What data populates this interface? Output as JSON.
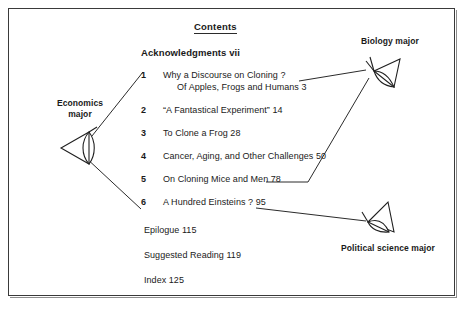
{
  "page": {
    "heading": "Contents",
    "acknowledgments": "Acknowledgments  vii"
  },
  "contents": {
    "chapters": [
      {
        "number": "1",
        "title": "Why a Discourse on Cloning ?",
        "subtitle": "Of Apples, Frogs and Humans  3"
      },
      {
        "number": "2",
        "title": "“A Fantastical Experiment”  14",
        "subtitle": ""
      },
      {
        "number": "3",
        "title": "To Clone a Frog  28",
        "subtitle": ""
      },
      {
        "number": "4",
        "title": "Cancer, Aging, and Other Challenges  50",
        "subtitle": ""
      },
      {
        "number": "5",
        "title": "On Cloning Mice and Men  78",
        "subtitle": ""
      },
      {
        "number": "6",
        "title": "A Hundred Einsteins ?  95",
        "subtitle": ""
      }
    ],
    "back_matter": [
      "Epilogue  115",
      "Suggested Reading  119",
      "Index  125"
    ]
  },
  "annotations": {
    "viewpoints": [
      {
        "id": "economics",
        "label": "Economics major",
        "label_lines": [
          "Economics",
          "major"
        ],
        "icon": "eye-viewpoint-icon",
        "links_to": [
          "chapter-1",
          "chapter-6"
        ]
      },
      {
        "id": "biology",
        "label": "Biology major",
        "label_lines": [
          "Biology major"
        ],
        "icon": "eye-viewpoint-icon",
        "links_to": [
          "chapter-1",
          "chapter-5"
        ]
      },
      {
        "id": "political-science",
        "label": "Political science major",
        "label_lines": [
          "Political science major"
        ],
        "icon": "eye-viewpoint-icon",
        "links_to": [
          "chapter-6"
        ]
      }
    ]
  },
  "style": {
    "ink": "#2b2b2b",
    "paper": "#ffffff",
    "frame": "#3a3a3a"
  }
}
